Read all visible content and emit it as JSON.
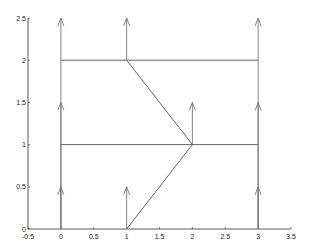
{
  "chart_data": {
    "type": "line",
    "title": "",
    "xlabel": "",
    "ylabel": "",
    "xlim": [
      -0.5,
      3.5
    ],
    "ylim": [
      0,
      2.5
    ],
    "grid": false,
    "xticks": [
      "-0.5",
      "0",
      "0.5",
      "1",
      "1.5",
      "2",
      "2.5",
      "3",
      "3.5"
    ],
    "yticks": [
      "0",
      "0.5",
      "1",
      "1.5",
      "2",
      "2.5"
    ],
    "line_segments": [
      {
        "from": [
          0,
          2
        ],
        "to": [
          3,
          2
        ]
      },
      {
        "from": [
          0,
          1
        ],
        "to": [
          3,
          1
        ]
      },
      {
        "from": [
          1,
          2
        ],
        "to": [
          2,
          1
        ]
      },
      {
        "from": [
          1,
          0
        ],
        "to": [
          2,
          1
        ]
      }
    ],
    "arrows": [
      {
        "start": [
          0,
          0
        ],
        "end": [
          0,
          0.5
        ]
      },
      {
        "start": [
          0,
          0
        ],
        "end": [
          0,
          1.5
        ]
      },
      {
        "start": [
          0,
          0
        ],
        "end": [
          0,
          2.5
        ]
      },
      {
        "start": [
          1,
          0
        ],
        "end": [
          1,
          0.5
        ]
      },
      {
        "start": [
          1,
          2
        ],
        "end": [
          1,
          2.5
        ]
      },
      {
        "start": [
          2,
          1
        ],
        "end": [
          2,
          1.5
        ]
      },
      {
        "start": [
          3,
          0
        ],
        "end": [
          3,
          0.5
        ]
      },
      {
        "start": [
          3,
          0
        ],
        "end": [
          3,
          1.5
        ]
      },
      {
        "start": [
          3,
          0
        ],
        "end": [
          3,
          2.5
        ]
      }
    ],
    "colors": {
      "line": "#555555",
      "arrow": "#777777",
      "axis": "#333333"
    }
  }
}
